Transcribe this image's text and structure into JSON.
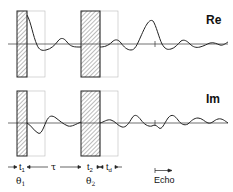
{
  "diagram": {
    "title": "",
    "panels": [
      {
        "label": "Re",
        "signal": "real part of signal"
      },
      {
        "label": "Im",
        "signal": "imaginary part of signal"
      }
    ],
    "pulses": [
      {
        "name": "pulse-1",
        "angle_label": "θ1",
        "width_label": "t1"
      },
      {
        "name": "pulse-2",
        "angle_label": "θ2",
        "width_label": "t2"
      }
    ],
    "intervals": {
      "tau": "τ",
      "t1": "t₁",
      "t2": "t₂",
      "td": "t_d"
    },
    "labels": {
      "re": "Re",
      "im": "Im",
      "theta1": "θ",
      "theta1_sub": "1",
      "theta2": "θ",
      "theta2_sub": "2",
      "t1": "t",
      "t1_sub": "1",
      "t2": "t",
      "t2_sub": "2",
      "td": "t",
      "td_sub": "d",
      "tau": "τ",
      "echo": "Echo"
    },
    "colors": {
      "line": "#222222",
      "box_outline": "#bbbbbb",
      "hatch": "#444444"
    }
  }
}
